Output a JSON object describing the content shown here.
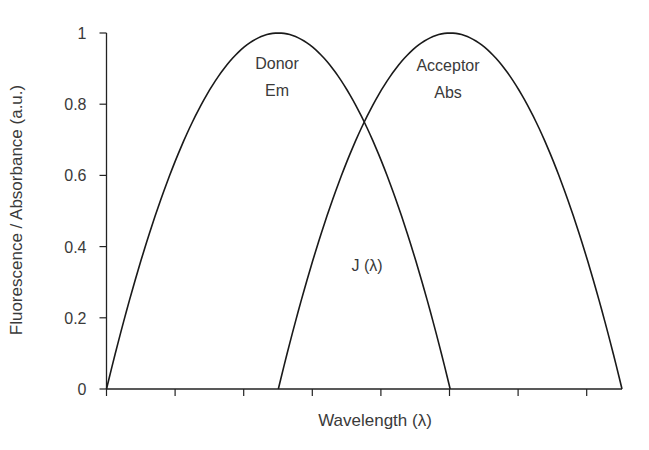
{
  "chart_data": {
    "type": "line",
    "title": "",
    "xlabel": "Wavelength (λ)",
    "ylabel": "Fluorescence / Absorbance (a.u.)",
    "ylim": [
      0,
      1
    ],
    "xlim": [
      0,
      7.5
    ],
    "yticks": [
      "0",
      "0.2",
      "0.4",
      "0.6",
      "0.8",
      "1"
    ],
    "ytick_values": [
      0,
      0.2,
      0.4,
      0.6,
      0.8,
      1
    ],
    "xtick_count": 8,
    "xtick_labels": [],
    "grid": false,
    "legend": "none",
    "series": [
      {
        "name": "Donor Em",
        "label_lines": [
          "Donor",
          "Em"
        ],
        "shape": "parabola",
        "x": [
          0,
          0.5,
          1,
          1.5,
          2,
          2.5,
          3,
          3.5,
          4,
          4.5,
          5
        ],
        "values": [
          0,
          0.36,
          0.64,
          0.84,
          0.96,
          1.0,
          0.96,
          0.84,
          0.64,
          0.36,
          0
        ]
      },
      {
        "name": "Acceptor Abs",
        "label_lines": [
          "Acceptor",
          "Abs"
        ],
        "shape": "parabola",
        "x": [
          2.5,
          3,
          3.5,
          4,
          4.5,
          5,
          5.5,
          6,
          6.5,
          7,
          7.5
        ],
        "values": [
          0,
          0.36,
          0.64,
          0.84,
          0.96,
          1.0,
          0.96,
          0.84,
          0.64,
          0.36,
          0
        ]
      }
    ],
    "annotations": [
      {
        "text": "Donor",
        "near": "Donor Em peak"
      },
      {
        "text": "Em",
        "near": "Donor Em peak"
      },
      {
        "text": "Acceptor",
        "near": "Acceptor Abs peak"
      },
      {
        "text": "Abs",
        "near": "Acceptor Abs peak"
      },
      {
        "text": "J (λ)",
        "near": "spectral overlap region"
      }
    ],
    "overlap_crossing": {
      "x": 3.75,
      "y": 0.75
    }
  },
  "labels": {
    "ylabel": "Fluorescence / Absorbance (a.u.)",
    "xlabel": "Wavelength (λ)",
    "donor_line1": "Donor",
    "donor_line2": "Em",
    "acceptor_line1": "Acceptor",
    "acceptor_line2": "Abs",
    "overlap": "J (λ)"
  },
  "colors": {
    "line": "#1a1a1a",
    "text": "#3a3a3a",
    "background": "#ffffff"
  }
}
